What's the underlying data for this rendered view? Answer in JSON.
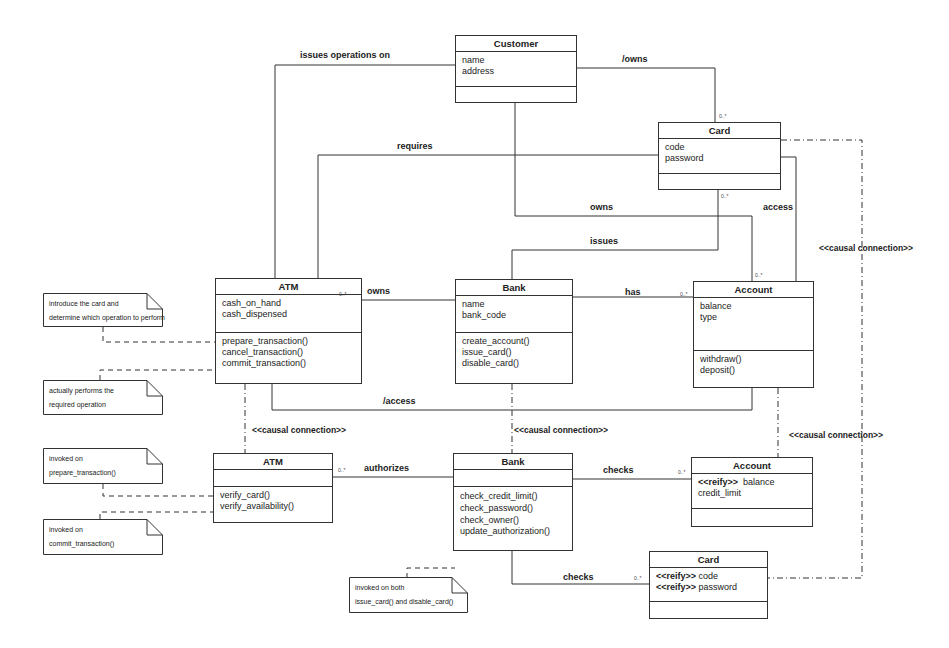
{
  "classes": {
    "customer": {
      "name": "Customer",
      "attributes": [
        "name",
        "address"
      ],
      "operations": []
    },
    "card_top": {
      "name": "Card",
      "attributes": [
        "code",
        "password"
      ],
      "operations": []
    },
    "atm_top": {
      "name": "ATM",
      "attributes": [
        "cash_on_hand",
        "cash_dispensed"
      ],
      "operations": [
        "prepare_transaction()",
        "cancel_transaction()",
        "commit_transaction()"
      ]
    },
    "bank_top": {
      "name": "Bank",
      "attributes": [
        "name",
        "bank_code"
      ],
      "operations": [
        "create_account()",
        "issue_card()",
        "disable_card()"
      ]
    },
    "account_top": {
      "name": "Account",
      "attributes": [
        "balance",
        "type"
      ],
      "operations": [
        "withdraw()",
        "deposit()"
      ]
    },
    "atm_meta": {
      "name": "ATM",
      "attributes": [],
      "operations": [
        "verify_card()",
        "verify_availability()"
      ]
    },
    "bank_meta": {
      "name": "Bank",
      "attributes": [],
      "operations": [
        "check_credit_limit()",
        "check_password()",
        "check_owner()",
        "update_authorization()"
      ]
    },
    "account_meta": {
      "name": "Account",
      "attributes": [
        {
          "stereotype": "<<reify>>",
          "name": "balance"
        },
        {
          "stereotype": "",
          "name": "credit_limit"
        }
      ],
      "operations": []
    },
    "card_meta": {
      "name": "Card",
      "attributes": [
        {
          "stereotype": "<<reify>>",
          "name": "code"
        },
        {
          "stereotype": "<<reify>>",
          "name": "password"
        }
      ],
      "operations": []
    }
  },
  "notes": {
    "n1": [
      "introduce the card and",
      "determine which operation to perform"
    ],
    "n2": [
      "actually performs the",
      "required operation"
    ],
    "n3": [
      "invoked on",
      "prepare_transaction()"
    ],
    "n4": [
      "invoked on",
      "commit_transaction()"
    ],
    "n5": [
      "invoked on both",
      "issue_card() and disable_card()"
    ]
  },
  "associations": {
    "issues_operations_on": "issues operations on",
    "owns_card": "/owns",
    "requires": "requires",
    "owns_account": "owns",
    "access": "access",
    "issues": "issues",
    "atm_owns": "owns",
    "has": "has",
    "slash_access": "/access",
    "authorizes": "authorizes",
    "checks_account": "checks",
    "checks_card": "checks"
  },
  "causal": {
    "c1": "<<causal connection>>",
    "c2": "<<causal connection>>",
    "c3": "<<causal connection>>",
    "c4": "<<causal connection>>"
  },
  "multiplicity": "0..*"
}
